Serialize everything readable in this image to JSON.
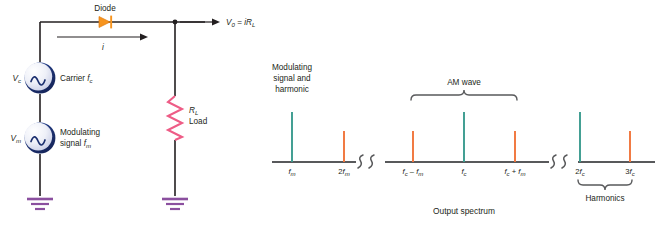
{
  "figure": {
    "title": "",
    "caption": "Output spectrum",
    "colors": {
      "wire": "#231f20",
      "diode": "#f7941e",
      "resistor": "#ee5c86",
      "ground": "#8b4f9f",
      "source_ring": "#1f3e86",
      "source_fill": "#e8eaf5",
      "spectrum_teal": "#3a9b8f",
      "spectrum_orange": "#f1743a",
      "axis": "#58595b"
    }
  },
  "circuit": {
    "diode_label": "Diode",
    "current_label": "i",
    "output_label": "V0 = iRL",
    "output_label_parts": {
      "v": "V",
      "v_sub": "0",
      "eq": " = ",
      "i": "i",
      "r": "R",
      "r_sub": "L"
    },
    "carrier_source": {
      "symbol": "V",
      "symbol_sub": "c",
      "name": "Carrier",
      "freq": "f",
      "freq_sub": "c"
    },
    "modulating_source": {
      "symbol": "V",
      "symbol_sub": "m",
      "name_line1": "Modulating",
      "name_line2": "signal",
      "freq": "f",
      "freq_sub": "m"
    },
    "load": {
      "symbol": "R",
      "symbol_sub": "L",
      "name": "Load"
    }
  },
  "chart_data": {
    "type": "bar",
    "title": "Output spectrum",
    "xlabel": "",
    "ylabel": "",
    "grid": false,
    "legend": null,
    "axis_break_positions": [
      2.5,
      5.5
    ],
    "categories": [
      "fm",
      "2fm",
      "fc - fm",
      "fc",
      "fc + fm",
      "2fc",
      "3fc"
    ],
    "tick_labels": [
      {
        "base": "f",
        "sub": "m",
        "prefix": "",
        "text": "fm"
      },
      {
        "base": "f",
        "sub": "m",
        "prefix": "2",
        "text": "2fm"
      },
      {
        "base": "f",
        "sub": "",
        "prefix": "",
        "text": "fc - fm"
      },
      {
        "base": "f",
        "sub": "c",
        "prefix": "",
        "text": "fc"
      },
      {
        "base": "f",
        "sub": "",
        "prefix": "",
        "text": "fc + fm"
      },
      {
        "base": "f",
        "sub": "c",
        "prefix": "2",
        "text": "2fc"
      },
      {
        "base": "f",
        "sub": "c",
        "prefix": "3",
        "text": "3fc"
      }
    ],
    "values": [
      1.0,
      0.62,
      0.62,
      1.0,
      0.62,
      1.0,
      0.62
    ],
    "series": [
      {
        "name": "spectral lines",
        "points": [
          {
            "label": "fm",
            "x": 292,
            "height": 1.0,
            "color": "#3a9b8f"
          },
          {
            "label": "2fm",
            "x": 344,
            "height": 0.62,
            "color": "#f1743a"
          },
          {
            "label": "fc - fm",
            "x": 413,
            "height": 0.62,
            "color": "#f1743a"
          },
          {
            "label": "fc",
            "x": 464,
            "height": 1.0,
            "color": "#3a9b8f"
          },
          {
            "label": "fc + fm",
            "x": 515,
            "height": 0.62,
            "color": "#f1743a"
          },
          {
            "label": "2fc",
            "x": 580,
            "height": 1.0,
            "color": "#3a9b8f"
          },
          {
            "label": "3fc",
            "x": 630,
            "height": 0.62,
            "color": "#f1743a"
          }
        ]
      }
    ],
    "annotations": [
      {
        "name": "modulating-annotation",
        "lines": [
          "Modulating",
          "signal and",
          "harmonic"
        ],
        "target": "fm"
      },
      {
        "name": "am-wave-annotation",
        "lines": [
          "AM wave"
        ],
        "target": "fc",
        "brace": "top"
      },
      {
        "name": "harmonics-annotation",
        "lines": [
          "Harmonics"
        ],
        "target": "2fc-3fc",
        "brace": "bottom"
      }
    ]
  }
}
